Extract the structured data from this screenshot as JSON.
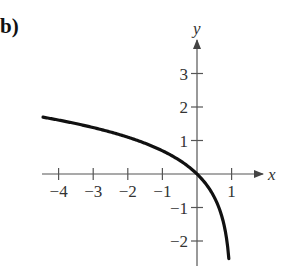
{
  "panel_label": "b)",
  "chart_data": {
    "type": "line",
    "title": "",
    "function": "y = ln(1 - x)",
    "xlabel": "x",
    "ylabel": "y",
    "xlim": [
      -4.5,
      1.9
    ],
    "ylim": [
      -2.7,
      3.9
    ],
    "x_ticks": [
      -4,
      -3,
      -2,
      -1,
      1
    ],
    "x_tick_labels": [
      "−4",
      "−3",
      "−2",
      "−1",
      "1"
    ],
    "y_ticks": [
      -2,
      -1,
      1,
      2,
      3
    ],
    "y_tick_labels": [
      "−2",
      "−1",
      "1",
      "2",
      "3"
    ],
    "grid": false,
    "legend": null,
    "series": [
      {
        "name": "curve",
        "color": "#111111",
        "x": [
          -4.45,
          -4,
          -3,
          -2,
          -1,
          -0.5,
          0,
          0.5,
          0.75,
          0.9,
          0.92
        ],
        "y": [
          1.66,
          1.61,
          1.39,
          1.1,
          0.69,
          0.41,
          0,
          -0.69,
          -1.39,
          -2.3,
          -2.53
        ]
      }
    ]
  }
}
